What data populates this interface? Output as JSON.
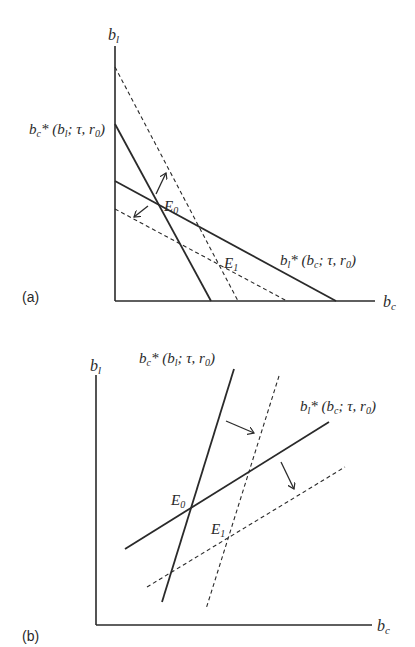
{
  "panel_a": {
    "label": "(a)",
    "y_axis_label": "b",
    "y_axis_sub": "l",
    "x_axis_label": "b",
    "x_axis_sub": "c",
    "curve_bc_label": {
      "b": "b",
      "sub": "c",
      "rest": "* (b",
      "sub2": "l",
      "rest2": "; τ, r",
      "sub3": "0",
      "end": ")"
    },
    "curve_bl_label": {
      "b": "b",
      "sub": "l",
      "rest": "* (b",
      "sub2": "c",
      "rest2": "; τ, r",
      "sub3": "0",
      "end": ")"
    },
    "eq0": {
      "E": "E",
      "sub": "0"
    },
    "eq1": {
      "E": "E",
      "sub": "1"
    }
  },
  "panel_b": {
    "label": "(b)",
    "y_axis_label": "b",
    "y_axis_sub": "l",
    "x_axis_label": "b",
    "x_axis_sub": "c",
    "curve_bc_label": {
      "b": "b",
      "sub": "c",
      "rest": "* (b",
      "sub2": "l",
      "rest2": "; τ, r",
      "sub3": "0",
      "end": ")"
    },
    "curve_bl_label": {
      "b": "b",
      "sub": "l",
      "rest": "* (b",
      "sub2": "c",
      "rest2": "; τ, r",
      "sub3": "0",
      "end": ")"
    },
    "eq0": {
      "E": "E",
      "sub": "0"
    },
    "eq1": {
      "E": "E",
      "sub": "1"
    }
  }
}
